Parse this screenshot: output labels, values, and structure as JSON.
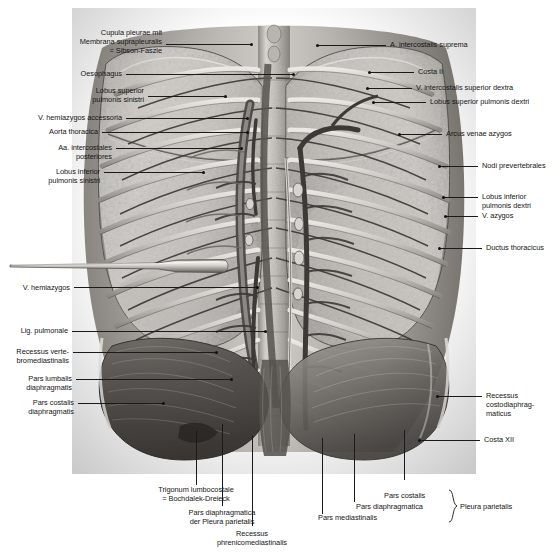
{
  "plate": {
    "type": "anatomical-illustration",
    "subject": "Pleura parietalis — posterior thoracic wall, situs from behind",
    "style": "grayscale engraving / halftone",
    "background_color": "#ffffff",
    "text_color": "#161616",
    "leader_color": "#1a1a1a"
  },
  "labels_left": [
    {
      "id": "cupula-pleurae",
      "text": "Cupula pleurae mit\nMembrana suprapleuralis\n= Sibson-Faszie"
    },
    {
      "id": "oesophagus",
      "text": "Oesophagus"
    },
    {
      "id": "lobus-sup-sin",
      "text": "Lobus superior\npulmonis sinistri"
    },
    {
      "id": "v-hemiazygos-acc",
      "text": "V. hemiazygos accessoria"
    },
    {
      "id": "aorta-thoracica",
      "text": "Aorta thoracica"
    },
    {
      "id": "aa-intercostales",
      "text": "Aa. intercostales\nposteriores"
    },
    {
      "id": "lobus-inf-sin",
      "text": "Lobus inferior\npulmonis sinistri"
    },
    {
      "id": "v-hemiazygos",
      "text": "V. hemiazygos"
    },
    {
      "id": "lig-pulmonale",
      "text": "Lig. pulmonale"
    },
    {
      "id": "recessus-vertebro",
      "text": "Recessus verte-\nbromediastinalis"
    },
    {
      "id": "pars-lumbalis",
      "text": "Pars lumbalis\ndiaphragmatis"
    },
    {
      "id": "pars-costalis-diaph",
      "text": "Pars costalis\ndiaphragmatis"
    }
  ],
  "labels_right": [
    {
      "id": "a-intercostalis-suprema",
      "text": "A. intercostalis suprema"
    },
    {
      "id": "costa-ii",
      "text": "Costa II"
    },
    {
      "id": "v-intercostalis-sup-dex",
      "text": "V. intercostalis superior dextra"
    },
    {
      "id": "lobus-sup-dex",
      "text": "Lobus superior pulmonis dextri"
    },
    {
      "id": "arcus-venae-azygos",
      "text": "Arcus venae azygos"
    },
    {
      "id": "nodi-prevertebrales",
      "text": "Nodi prevertebrales"
    },
    {
      "id": "lobus-inf-dex",
      "text": "Lobus inferior\npulmonis dextri"
    },
    {
      "id": "v-azygos",
      "text": "V. azygos"
    },
    {
      "id": "ductus-thoracicus",
      "text": "Ductus thoracicus"
    },
    {
      "id": "recessus-costodiaph",
      "text": "Recessus\ncostodiaphrag-\nmaticus"
    },
    {
      "id": "costa-xii",
      "text": "Costa XII"
    }
  ],
  "labels_bottom": [
    {
      "id": "trigonum-lumbocostale",
      "text": "Trigonum lumbocostale\n= Bochdalek-Dreieck"
    },
    {
      "id": "pars-diaph-pleura",
      "text": "Pars diaphragmatica\nder Pleura parietalis"
    },
    {
      "id": "recessus-phrenico",
      "text": "Recessus\nphrenicomediastinalis"
    },
    {
      "id": "pars-mediastinalis",
      "text": "Pars mediastinalis"
    },
    {
      "id": "pars-diaphragmatica",
      "text": "Pars diaphragmatica"
    },
    {
      "id": "pars-costalis",
      "text": "Pars costalis"
    },
    {
      "id": "pleura-parietalis",
      "text": "Pleura parietalis"
    }
  ],
  "instrument": {
    "id": "probe",
    "name": "surgical probe / spatula",
    "description": "flat metal spatula inserted horizontally into the left hemithorax"
  }
}
